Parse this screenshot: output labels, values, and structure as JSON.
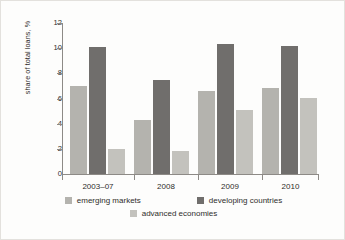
{
  "chart_data": {
    "type": "bar",
    "title": "",
    "subtitle": "",
    "xlabel": "",
    "ylabel": "share of total loans, %",
    "categories": [
      "2003–07",
      "2008",
      "2009",
      "2010"
    ],
    "series": [
      {
        "name": "emerging markets",
        "color": "#b4b3ae",
        "values": [
          7.0,
          4.3,
          6.6,
          6.8
        ]
      },
      {
        "name": "developing countries",
        "color": "#706e6c",
        "values": [
          10.1,
          7.5,
          10.3,
          10.2
        ]
      },
      {
        "name": "advanced economies",
        "color": "#c3c2bd",
        "values": [
          2.0,
          1.85,
          5.05,
          6.05
        ]
      }
    ],
    "ylim": [
      0,
      12
    ],
    "yticks": [
      0,
      2,
      4,
      6,
      8,
      10,
      12
    ],
    "ytick_labels": [
      "0",
      "2",
      "4",
      "6",
      "8",
      "10",
      "12"
    ],
    "grid": false,
    "legend_position": "bottom"
  },
  "legend": {
    "items": [
      {
        "label": "emerging markets",
        "swatch": "s-emerging"
      },
      {
        "label": "developing countries",
        "swatch": "s-developing"
      },
      {
        "label": "advanced economies",
        "swatch": "s-advanced"
      }
    ]
  },
  "axis": {
    "y_title": "share of total loans, %",
    "tick_0": "0",
    "tick_2": "2",
    "tick_4": "4",
    "tick_6": "6",
    "tick_8": "8",
    "tick_10": "10",
    "tick_12": "12"
  },
  "xlabels": {
    "g0": "2003–07",
    "g1": "2008",
    "g2": "2009",
    "g3": "2010"
  }
}
